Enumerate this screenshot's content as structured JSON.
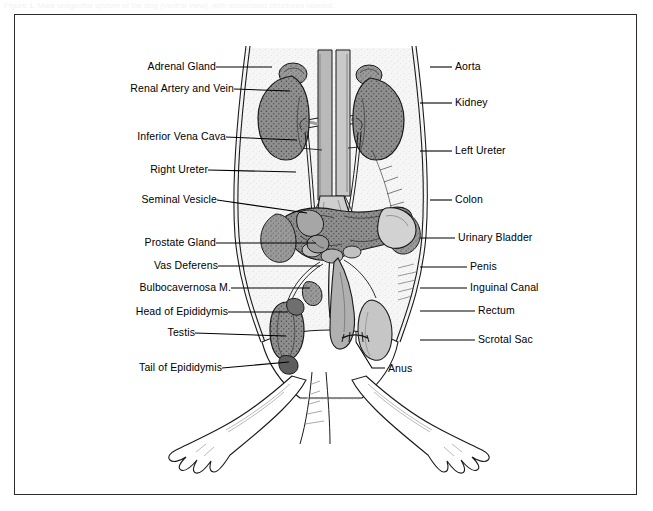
{
  "caption": {
    "text": "Figure 1.  Male urogenital system of the dog (ventral view), with associated structures labeled."
  },
  "frame": {
    "border_color": "#2b2b2b",
    "background": "#ffffff"
  },
  "figure": {
    "type": "anatomical-illustration",
    "style": "black-and-white stippled line drawing",
    "colors": {
      "outline": "#1a1a1a",
      "body_fill": "#f4f4f4",
      "organ_mid": "#8d8d8d",
      "organ_dark": "#4a4a4a",
      "organ_light": "#c9c9c9",
      "vessel": "#a8a8a8"
    }
  },
  "labels": {
    "left": [
      {
        "text": "Adrenal Gland",
        "x": 213,
        "y": 67,
        "line_to_x": 272,
        "line_to_y": 67
      },
      {
        "text": "Renal Artery and Vein",
        "x": 231,
        "y": 89,
        "line_to_x": 290,
        "line_to_y": 91
      },
      {
        "text": "Inferior Vena Cava",
        "x": 223,
        "y": 137,
        "line_to_x": 297,
        "line_to_y": 140
      },
      {
        "text": "Right Ureter",
        "x": 205,
        "y": 170,
        "line_to_x": 296,
        "line_to_y": 172
      },
      {
        "text": "Seminal Vesicle",
        "x": 214,
        "y": 200,
        "line_to_x": 307,
        "line_to_y": 213
      },
      {
        "text": "Prostate Gland",
        "x": 213,
        "y": 243,
        "line_to_x": 316,
        "line_to_y": 243
      },
      {
        "text": "Vas Deferens",
        "x": 215,
        "y": 266,
        "line_to_x": 320,
        "line_to_y": 266
      },
      {
        "text": "Bulbocavernosa M.",
        "x": 228,
        "y": 288,
        "line_to_x": 310,
        "line_to_y": 288
      },
      {
        "text": "Head of Epididymis",
        "x": 225,
        "y": 312,
        "line_to_x": 288,
        "line_to_y": 312
      },
      {
        "text": "Testis",
        "x": 192,
        "y": 333,
        "line_to_x": 286,
        "line_to_y": 336
      },
      {
        "text": "Tail of Epididymis",
        "x": 219,
        "y": 368,
        "line_to_x": 289,
        "line_to_y": 362
      }
    ],
    "right": [
      {
        "text": "Aorta",
        "x": 455,
        "y": 67,
        "line_from_x": 430,
        "line_from_y": 67
      },
      {
        "text": "Kidney",
        "x": 455,
        "y": 103,
        "line_from_x": 420,
        "line_from_y": 103
      },
      {
        "text": "Left Ureter",
        "x": 455,
        "y": 151,
        "line_from_x": 420,
        "line_from_y": 151
      },
      {
        "text": "Colon",
        "x": 455,
        "y": 200,
        "line_from_x": 430,
        "line_from_y": 200
      },
      {
        "text": "Urinary Bladder",
        "x": 458,
        "y": 238,
        "line_from_x": 420,
        "line_from_y": 238
      },
      {
        "text": "Penis",
        "x": 470,
        "y": 267,
        "line_from_x": 420,
        "line_from_y": 267
      },
      {
        "text": "Inguinal Canal",
        "x": 470,
        "y": 288,
        "line_from_x": 420,
        "line_from_y": 288
      },
      {
        "text": "Rectum",
        "x": 478,
        "y": 311,
        "line_from_x": 420,
        "line_from_y": 311
      },
      {
        "text": "Scrotal Sac",
        "x": 478,
        "y": 340,
        "line_from_x": 420,
        "line_from_y": 340
      }
    ],
    "bottom": [
      {
        "text": "Anus",
        "x": 388,
        "y": 371,
        "line_from_x": 380,
        "line_from_y": 369
      }
    ]
  }
}
